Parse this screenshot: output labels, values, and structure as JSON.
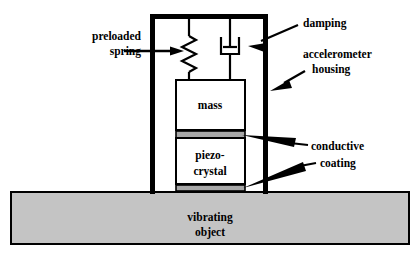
{
  "diagram": {
    "type": "cross-section-schematic",
    "colors": {
      "stroke": "#000000",
      "background": "#ffffff",
      "coating_fill": "#a8a8a8",
      "vibrating_object_fill": "#c4c4c4",
      "box_fill": "#ffffff"
    },
    "labels": {
      "preloaded_spring_line1": "preloaded",
      "preloaded_spring_line2": "spring",
      "damping": "damping",
      "accelerometer_housing_line1": "accelerometer",
      "accelerometer_housing_line2": "housing",
      "conductive_coating_line1": "conductive",
      "conductive_coating_line2": "coating",
      "mass": "mass",
      "piezo_crystal_line1": "piezo-",
      "piezo_crystal_line2": "crystal",
      "vibrating_object_line1": "vibrating",
      "vibrating_object_line2": "object"
    },
    "components": [
      {
        "name": "accelerometer-housing",
        "label": "accelerometer housing"
      },
      {
        "name": "preloaded-spring",
        "label": "preloaded spring"
      },
      {
        "name": "damping-dashpot",
        "label": "damping"
      },
      {
        "name": "seismic-mass",
        "label": "mass"
      },
      {
        "name": "piezo-crystal",
        "label": "piezo-crystal"
      },
      {
        "name": "conductive-coating-top",
        "label": "conductive coating"
      },
      {
        "name": "conductive-coating-bottom",
        "label": "conductive coating"
      },
      {
        "name": "vibrating-object",
        "label": "vibrating object"
      }
    ]
  }
}
